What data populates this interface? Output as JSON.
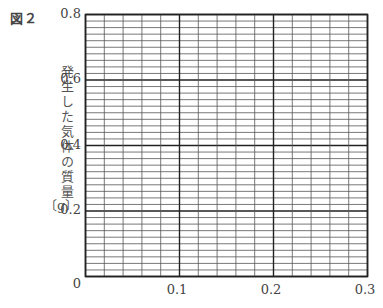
{
  "figure": {
    "label": "図２"
  },
  "chart_data": {
    "type": "line",
    "title": "",
    "xlabel": "",
    "ylabel": "発生した気体の質量",
    "yunit": "〔g〕",
    "xlim": [
      0,
      0.3
    ],
    "ylim": [
      0,
      0.8
    ],
    "x_ticks": [
      "0.1",
      "0.2",
      "0.3"
    ],
    "y_ticks": [
      "0",
      "0.2",
      "0.4",
      "0.6",
      "0.8"
    ],
    "origin_label": "0",
    "grid": true,
    "grid_minor_columns": 15,
    "grid_minor_rows": 40,
    "grid_major_every_columns": 5,
    "grid_major_every_rows": 10,
    "series": [],
    "note": "Blank graph paper for plotting; no data points drawn"
  },
  "colors": {
    "grid_minor": "#555555",
    "grid_major": "#222222",
    "text": "#444444"
  }
}
